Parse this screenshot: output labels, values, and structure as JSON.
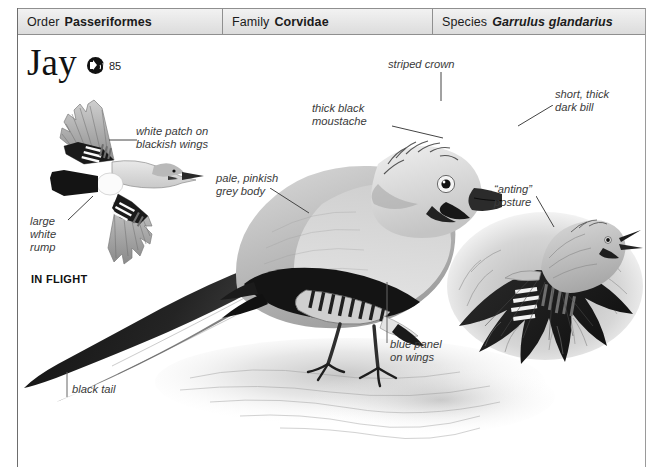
{
  "page": {
    "width": 652,
    "height": 475,
    "background": "#ffffff"
  },
  "taxonomy": {
    "order": {
      "label": "Order",
      "value": "Passeriformes"
    },
    "family": {
      "label": "Family",
      "value": "Corvidae"
    },
    "species": {
      "label": "Species",
      "value": "Garrulus glandarius"
    }
  },
  "title": {
    "common_name": "Jay",
    "sound_icon": "speaker-icon",
    "page_number": "85"
  },
  "illustrations": {
    "flight": {
      "caption": "IN FLIGHT",
      "labels": [
        {
          "id": "white-patch",
          "text": "white patch on\nblackish wings"
        },
        {
          "id": "white-rump",
          "text": "large\nwhite\nrump"
        }
      ]
    },
    "perched": {
      "labels": [
        {
          "id": "striped-crown",
          "text": "striped crown"
        },
        {
          "id": "thick-black-moustache",
          "text": "thick black\nmoustache"
        },
        {
          "id": "short-thick-dark-bill",
          "text": "short, thick\ndark bill"
        },
        {
          "id": "pale-pinkish-grey-body",
          "text": "pale, pinkish\ngrey body"
        },
        {
          "id": "blue-panel-on-wings",
          "text": "blue panel\non wings"
        },
        {
          "id": "black-tail",
          "text": "black tail"
        }
      ]
    },
    "anting": {
      "labels": [
        {
          "id": "anting-posture",
          "text": "“anting”\nposture"
        }
      ]
    }
  },
  "colors": {
    "frame": "#6d6d6d",
    "header_fill": "#e6e6e6",
    "header_border": "#8f8f8f",
    "label_text": "#3a3a3a",
    "title_text": "#121212",
    "icon_fill": "#111111"
  }
}
